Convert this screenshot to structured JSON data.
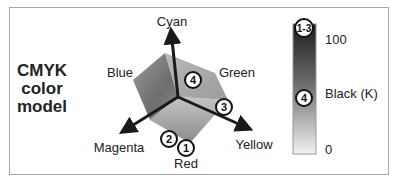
{
  "title": {
    "lines": [
      "CMYK",
      "color",
      "model"
    ]
  },
  "axes": {
    "cyan": "Cyan",
    "magenta": "Magenta",
    "yellow": "Yellow"
  },
  "vertices": {
    "blue": "Blue",
    "green": "Green",
    "red": "Red"
  },
  "markers": {
    "m1": "1",
    "m2": "2",
    "m3": "3",
    "m4": "4",
    "m13": "1-3"
  },
  "black_scale": {
    "label": "Black (K)",
    "max": "100",
    "min": "0",
    "top_marker": "1-3",
    "mid_marker": "4"
  },
  "colors": {
    "frame": "#a8a8a8",
    "axis": "#1a1a1a",
    "text": "#222222"
  }
}
